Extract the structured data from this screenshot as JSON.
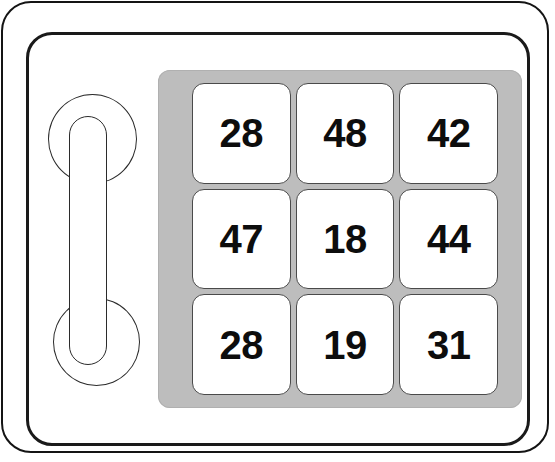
{
  "device": {
    "name": "numeric-keypad-device",
    "outer_shell_color": "#ffffff",
    "outer_border_color": "#141414",
    "inner_border_color": "#1a1a1a"
  },
  "handle": {
    "name": "carry-handle",
    "stroke_color": "#2b2b2b",
    "parts": [
      "top-ring",
      "grip-bar",
      "bottom-ring"
    ]
  },
  "keypad": {
    "panel_color": "#bdbdbd",
    "key_background": "#ffffff",
    "key_border_color": "#4a4a4a",
    "key_text_color": "#0d0d0d",
    "rows": 3,
    "columns": 3,
    "keys": [
      {
        "row": 0,
        "col": 0,
        "label": "28"
      },
      {
        "row": 0,
        "col": 1,
        "label": "48"
      },
      {
        "row": 0,
        "col": 2,
        "label": "42"
      },
      {
        "row": 1,
        "col": 0,
        "label": "47"
      },
      {
        "row": 1,
        "col": 1,
        "label": "18"
      },
      {
        "row": 1,
        "col": 2,
        "label": "44"
      },
      {
        "row": 2,
        "col": 0,
        "label": "28"
      },
      {
        "row": 2,
        "col": 1,
        "label": "19"
      },
      {
        "row": 2,
        "col": 2,
        "label": "31"
      }
    ]
  }
}
